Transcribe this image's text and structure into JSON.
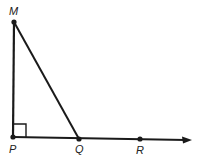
{
  "diagram": {
    "type": "geometry",
    "colors": {
      "stroke": "#1a1a1a",
      "label": "#222222",
      "background": "#ffffff"
    },
    "points": [
      {
        "id": "M",
        "label": "M",
        "x": 14,
        "y": 22
      },
      {
        "id": "P",
        "label": "P",
        "x": 13,
        "y": 137
      },
      {
        "id": "Q",
        "label": "Q",
        "x": 79,
        "y": 139
      },
      {
        "id": "R",
        "label": "R",
        "x": 140,
        "y": 139
      }
    ],
    "segments": [
      {
        "from": "M",
        "to": "P"
      },
      {
        "from": "M",
        "to": "Q"
      }
    ],
    "ray": {
      "from": "P",
      "through": "R",
      "arrow": true
    },
    "right_angle_marker": {
      "at": "P"
    }
  }
}
